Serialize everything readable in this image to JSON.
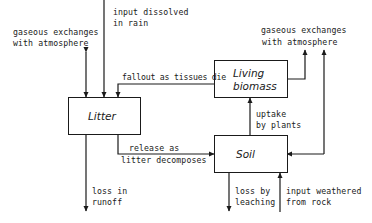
{
  "diagram": {
    "nodes": [
      {
        "id": "litter",
        "label": "Litter"
      },
      {
        "id": "living_biomass",
        "label_line1": "Living",
        "label_line2": "biomass"
      },
      {
        "id": "soil",
        "label": "Soil"
      }
    ],
    "edges": [
      {
        "id": "litter_atmosphere",
        "from": "litter",
        "to": "atmosphere",
        "bidirectional": true,
        "label_line1": "gaseous exchanges",
        "label_line2": "with atmosphere"
      },
      {
        "id": "rain_input",
        "from": "rain",
        "to": "litter",
        "label_line1": "input dissolved",
        "label_line2": "in rain"
      },
      {
        "id": "fallout",
        "from": "living_biomass",
        "to": "litter",
        "label": "fallout as tissues die"
      },
      {
        "id": "biomass_atmosphere",
        "from": "living_biomass",
        "to": "atmosphere",
        "label_line1": "gaseous exchanges",
        "label_line2": "with atmosphere"
      },
      {
        "id": "soil_atmosphere",
        "from": "atmosphere",
        "to": "soil",
        "bidirectional": true
      },
      {
        "id": "uptake",
        "from": "soil",
        "to": "living_biomass",
        "label_line1": "uptake",
        "label_line2": "by plants"
      },
      {
        "id": "release",
        "from": "litter",
        "to": "soil",
        "label_line1": "release as",
        "label_line2": "litter decomposes"
      },
      {
        "id": "runoff",
        "from": "litter",
        "to": "out",
        "label_line1": "loss in",
        "label_line2": "runoff"
      },
      {
        "id": "leaching",
        "from": "soil",
        "to": "out",
        "label_line1": "loss by",
        "label_line2": "leaching"
      },
      {
        "id": "weathering",
        "from": "rock",
        "to": "soil",
        "label_line1": "input weathered",
        "label_line2": "from rock"
      }
    ]
  },
  "colors": {
    "ink": "#1a1a1a",
    "background": "#ffffff"
  }
}
